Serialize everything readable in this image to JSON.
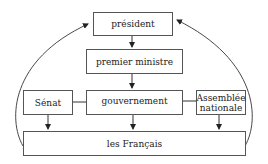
{
  "diagram": {
    "nodes": {
      "president": "président",
      "premier_ministre": "premier ministre",
      "senat": "Sénat",
      "gouvernement": "gouvernement",
      "assemblee_line1": "Assemblée",
      "assemblee_line2": "nationale",
      "francais": "les Français"
    },
    "edges": [
      {
        "from": "président",
        "to": "premier ministre"
      },
      {
        "from": "premier ministre",
        "to": "gouvernement"
      },
      {
        "from": "Sénat",
        "to": "les Français"
      },
      {
        "from": "gouvernement",
        "to": "les Français"
      },
      {
        "from": "Assemblée nationale",
        "to": "les Français"
      },
      {
        "from": "les Français",
        "to": "président",
        "side": "left",
        "curved": true
      },
      {
        "from": "les Français",
        "to": "président",
        "side": "right",
        "curved": true
      },
      {
        "from": "Sénat",
        "to": "gouvernement",
        "type": "line"
      },
      {
        "from": "gouvernement",
        "to": "Assemblée nationale",
        "type": "line"
      }
    ]
  }
}
